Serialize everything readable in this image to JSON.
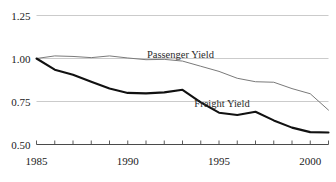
{
  "chart_data": {
    "type": "line",
    "title": "",
    "subtitle": "",
    "xlabel": "",
    "ylabel": "",
    "xlim": [
      1985,
      2001
    ],
    "ylim": [
      0.5,
      1.25
    ],
    "grid": true,
    "gridlines_y": [
      1.25,
      1.0,
      0.75,
      0.5
    ],
    "legend_position": "inline-annotation",
    "y_ticks": [
      "1.25",
      "1.00",
      "0.75",
      "0.50"
    ],
    "y_tick_values": [
      1.25,
      1.0,
      0.75,
      0.5
    ],
    "x_ticks": [
      "1985",
      "1990",
      "1995",
      "2000"
    ],
    "x_tick_values": [
      1985,
      1990,
      1995,
      2000
    ],
    "x_minor_tick_values": [
      1985,
      1986,
      1987,
      1988,
      1989,
      1990,
      1991,
      1992,
      1993,
      1994,
      1995,
      1996,
      1997,
      1998,
      1999,
      2000,
      2001
    ],
    "x": [
      1985,
      1986,
      1987,
      1988,
      1989,
      1990,
      1991,
      1992,
      1993,
      1994,
      1995,
      1996,
      1997,
      1998,
      1999,
      2000,
      2001
    ],
    "series": [
      {
        "name": "Passenger Yield",
        "color": "#7a7a7a",
        "line_width": 1.0,
        "label_text": "Passenger Yield",
        "values": [
          1.0,
          1.015,
          1.012,
          1.005,
          1.015,
          1.003,
          0.993,
          0.995,
          0.985,
          0.955,
          0.925,
          0.885,
          0.865,
          0.862,
          0.825,
          0.795,
          0.7
        ]
      },
      {
        "name": "Freight Yield",
        "color": "#111111",
        "line_width": 2.1,
        "label_text": "Freight Yield",
        "values": [
          1.0,
          0.935,
          0.905,
          0.865,
          0.825,
          0.8,
          0.797,
          0.803,
          0.818,
          0.745,
          0.685,
          0.672,
          0.69,
          0.64,
          0.598,
          0.572,
          0.57
        ]
      }
    ],
    "annotations": [
      {
        "text": "Passenger Yield",
        "x": 1991.05,
        "y": 1.028
      },
      {
        "text": "Freight Yield",
        "x": 1993.65,
        "y": 0.742
      }
    ]
  },
  "axes": {
    "y_axis_name": "yield-index",
    "x_axis_name": "year"
  }
}
